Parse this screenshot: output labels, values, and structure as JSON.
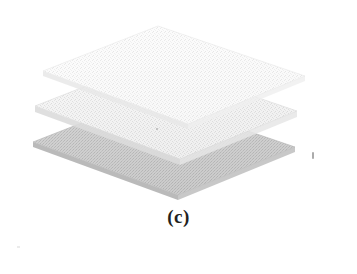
{
  "figure": {
    "caption": "(c)",
    "kind": "exploded-layer-stack-diagram",
    "background_color": "#ffffff",
    "layers": [
      {
        "id": "layer-top",
        "name": "top-sheet",
        "order": 1,
        "fill_color": "#f2f2f2",
        "edge_color": "#e3e3e3",
        "side_color": "#e8e8e8",
        "texture": "speckled-halftone",
        "polygon": "43,71 158,26 305,76 188,124"
      },
      {
        "id": "layer-middle",
        "name": "middle-sheet",
        "order": 2,
        "fill_color": "#eaeaea",
        "edge_color": "#d8d8d8",
        "side_color": "#dedede",
        "texture": "speckled-halftone",
        "polygon": "35,106 150,61 297,111 180,159"
      },
      {
        "id": "layer-bottom",
        "name": "bottom-sheet",
        "order": 3,
        "fill_color": "#c9c9c9",
        "edge_color": "#b4b4b4",
        "side_color": "#bdbdbd",
        "texture": "speckled-halftone",
        "polygon": "33,142 148,97 295,147 178,195"
      }
    ],
    "artifacts": [
      {
        "id": "scan-speck-right",
        "x": 312,
        "y": 152
      },
      {
        "id": "scan-speck-center",
        "x": 156,
        "y": 128
      },
      {
        "id": "scan-speck-bottomleft",
        "x": 17,
        "y": 246
      }
    ]
  }
}
